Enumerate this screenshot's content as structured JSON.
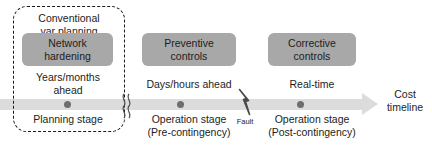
{
  "figure": {
    "colors": {
      "stage_box_fill": "#a8a8a8",
      "timeline_bar": "#dcdcdc",
      "dot": "#6e6e6e",
      "outline": "#1a1a1a",
      "text": "#1d1d1d"
    }
  },
  "enclosure": {
    "label": "Conventional\nvar planning"
  },
  "stages": [
    {
      "box_label": "Network\nhardening",
      "lead_time": "Years/months\nahead",
      "stage_label": "Planning stage"
    },
    {
      "box_label": "Preventive\ncontrols",
      "lead_time": "Days/hours ahead",
      "stage_label": "Operation stage\n(Pre-contingency)"
    },
    {
      "box_label": "Corrective\ncontrols",
      "lead_time": "Real-time",
      "stage_label": "Operation stage\n(Post-contingency)"
    }
  ],
  "markers": {
    "fault_label": "Fault",
    "break_symbol": "axis-break-squiggle"
  },
  "axis": {
    "end_label": "Cost\ntimeline"
  }
}
